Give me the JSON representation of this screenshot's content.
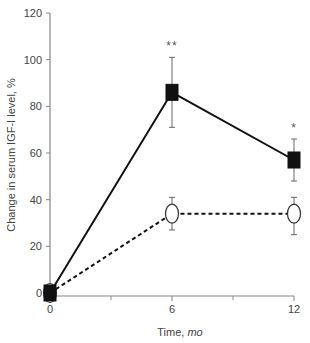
{
  "chart_data": {
    "type": "line",
    "title": "",
    "xlabel": "Time,",
    "xlabel_unit": "mo",
    "ylabel": "Change in serum IGF-I level, %",
    "x": [
      0,
      6,
      12
    ],
    "xticks_major": [
      0,
      6,
      12
    ],
    "xticks_minor": [
      3,
      9
    ],
    "xlim": [
      0,
      12
    ],
    "yticks": [
      0,
      20,
      40,
      60,
      80,
      100,
      120
    ],
    "ylim": [
      0,
      120
    ],
    "grid": false,
    "legend": null,
    "series": [
      {
        "name": "Filled squares (solid line)",
        "marker": "square-filled",
        "line_style": "solid",
        "values": [
          0,
          86,
          57
        ],
        "error_upper": [
          0,
          101,
          66
        ],
        "error_lower": [
          0,
          71,
          48
        ],
        "significance": [
          "",
          "**",
          "*"
        ]
      },
      {
        "name": "Open circles (dashed line)",
        "marker": "circle-open",
        "line_style": "dashed",
        "values": [
          0,
          34,
          34
        ],
        "error_upper": [
          0,
          41,
          41
        ],
        "error_lower": [
          0,
          27,
          25
        ],
        "significance": [
          "",
          "",
          ""
        ]
      }
    ]
  },
  "colors": {
    "axis": "#888888",
    "line": "#111111",
    "text": "#444444"
  }
}
